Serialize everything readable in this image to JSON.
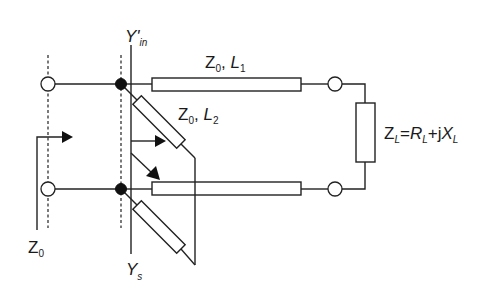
{
  "diagram": {
    "type": "transmission-line double-stub matching circuit",
    "labels": {
      "y_in_prime": {
        "main": "Y",
        "prime": "'",
        "sub": "in"
      },
      "line1": {
        "z": "Z",
        "z_sub": "0",
        "sep": ", ",
        "l": "L",
        "l_sub": "1"
      },
      "line2": {
        "z": "Z",
        "z_sub": "0",
        "sep": ", ",
        "l": "L",
        "l_sub": "2"
      },
      "load": {
        "z": "Z",
        "z_sub": "L",
        "eq": "=",
        "r": "R",
        "r_sub": "L",
        "plus": "+j",
        "x": "X",
        "x_sub": "L"
      },
      "source_impedance": {
        "main": "Z",
        "sub": "0"
      },
      "y_s": {
        "main": "Y",
        "sub": "s"
      }
    },
    "elements": [
      {
        "name": "source-terminal-top",
        "kind": "open-terminal"
      },
      {
        "name": "source-terminal-bottom",
        "kind": "open-terminal"
      },
      {
        "name": "junction-node-top",
        "kind": "node"
      },
      {
        "name": "junction-node-bottom",
        "kind": "node"
      },
      {
        "name": "transmission-line-L1-top",
        "kind": "line-segment"
      },
      {
        "name": "transmission-line-L1-bottom",
        "kind": "line-segment"
      },
      {
        "name": "stub-L2-top",
        "kind": "stub"
      },
      {
        "name": "stub-L2-bottom",
        "kind": "stub"
      },
      {
        "name": "load-terminal-top",
        "kind": "open-terminal"
      },
      {
        "name": "load-terminal-bottom",
        "kind": "open-terminal"
      },
      {
        "name": "load-impedance",
        "kind": "impedance"
      }
    ]
  }
}
